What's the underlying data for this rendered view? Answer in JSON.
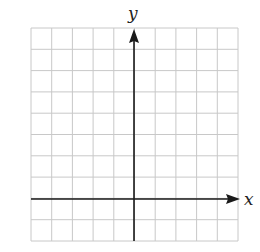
{
  "figure": {
    "type": "coordinate-grid",
    "x_axis_label": "x",
    "y_axis_label": "y",
    "grid": {
      "columns": 10,
      "rows": 10
    },
    "x_range": [
      -5,
      5
    ],
    "y_range": [
      -2,
      8
    ],
    "colors": {
      "grid": "#c8c8c8",
      "axis": "#1a1a1a",
      "background": "#ffffff"
    }
  }
}
